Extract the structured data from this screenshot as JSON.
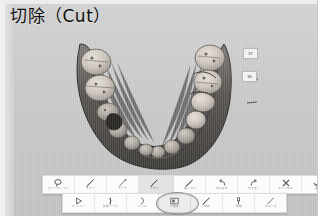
{
  "window": {
    "title": "切除（Cut）",
    "background_color": "#c9c9c9",
    "frame_color": "#f2f2f2"
  },
  "viewport": {
    "name": "3d-dental-model-viewport",
    "model": "mandibular-dental-arch-scan",
    "background_color": "#c7c7c7",
    "gingiva_color": "#555555",
    "tooth_color": "#cfc8c2",
    "callouts": [
      {
        "label": "37",
        "tooth": "lower-left-second-molar"
      },
      {
        "label": "36",
        "tooth": "lower-left-first-molar"
      }
    ]
  },
  "toolbar_top": {
    "name": "cut-tool-toolbar",
    "tools": [
      {
        "id": "free-select",
        "icon": "lasso-icon",
        "label": "フリーセレクト",
        "selected": false
      },
      {
        "id": "line",
        "icon": "pen-line-icon",
        "label": "ライン",
        "selected": false
      },
      {
        "id": "curve",
        "icon": "pen-curve-icon",
        "label": "カーブ",
        "selected": false
      },
      {
        "id": "brush",
        "icon": "brush-icon",
        "label": "ブラシ",
        "selected": true
      },
      {
        "id": "eraser",
        "icon": "eraser-icon",
        "label": "消しゴム",
        "selected": false
      },
      {
        "id": "undo",
        "icon": "undo-arrow-icon",
        "label": "元に戻す",
        "selected": false
      },
      {
        "id": "redo",
        "icon": "redo-arrow-icon",
        "label": "やり直し",
        "selected": false
      },
      {
        "id": "cancel",
        "icon": "close-x-icon",
        "label": "キャンセル",
        "selected": false
      },
      {
        "id": "confirm",
        "icon": "check-icon",
        "label": "実行",
        "selected": false
      }
    ]
  },
  "toolbar_bottom": {
    "name": "edit-mode-toolbar",
    "highlighted_tool_id": "cut",
    "tools": [
      {
        "id": "play",
        "icon": "play-triangle-icon",
        "label": "プレビュー"
      },
      {
        "id": "measure",
        "icon": "caliper-icon",
        "label": "計測ツール"
      },
      {
        "id": "trim",
        "icon": "scissor-curve-icon",
        "label": "トリム"
      },
      {
        "id": "fill",
        "icon": "fill-square-icon",
        "label": "穴埋め"
      },
      {
        "id": "cut",
        "icon": "cut-pen-icon",
        "label": "切除",
        "highlighted": true
      },
      {
        "id": "sculpt",
        "icon": "sculpt-icon",
        "label": "彫刻"
      },
      {
        "id": "smooth",
        "icon": "smooth-line-icon",
        "label": "スムース"
      }
    ]
  },
  "annotation": {
    "name": "highlight-ellipse",
    "shape": "ellipse",
    "target": "cut",
    "stroke_color": "#8e8e8e"
  }
}
